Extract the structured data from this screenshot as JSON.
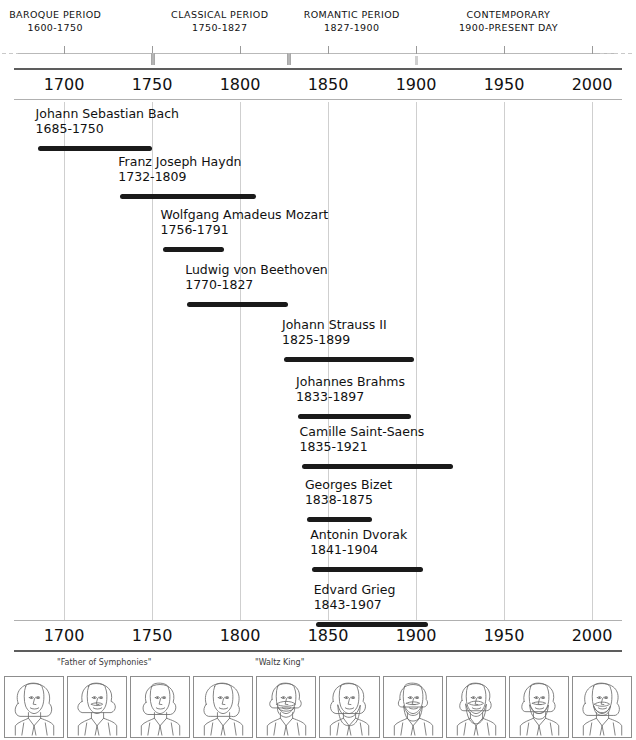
{
  "chart_data": {
    "type": "timeline",
    "axis": {
      "min": 1685,
      "max": 2010,
      "ticks": [
        1700,
        1750,
        1800,
        1850,
        1900,
        1950,
        2000
      ],
      "tick_labels": [
        "1700",
        "1750",
        "1800",
        "1850",
        "1900",
        "1950",
        "2000"
      ],
      "gridlines": [
        1700,
        1750,
        1800,
        1850,
        1900,
        1950,
        2000
      ],
      "axis_repeated_top_and_bottom": true
    },
    "periods": [
      {
        "name": "BAROQUE PERIOD",
        "years": "1600-1750",
        "start": 1600,
        "end": 1750
      },
      {
        "name": "CLASSICAL PERIOD",
        "years": "1750-1827",
        "start": 1750,
        "end": 1827
      },
      {
        "name": "ROMANTIC PERIOD",
        "years": "1827-1900",
        "start": 1827,
        "end": 1900
      },
      {
        "name": "CONTEMPORARY",
        "years": "1900-PRESENT DAY",
        "start": 1900,
        "end": 2010
      }
    ],
    "composers": [
      {
        "name": "Johann Sebastian Bach",
        "dates": "1685-1750",
        "birth": 1685,
        "death": 1750
      },
      {
        "name": "Franz Joseph Haydn",
        "dates": "1732-1809",
        "birth": 1732,
        "death": 1809
      },
      {
        "name": "Wolfgang Amadeus Mozart",
        "dates": "1756-1791",
        "birth": 1756,
        "death": 1791
      },
      {
        "name": "Ludwig von Beethoven",
        "dates": "1770-1827",
        "birth": 1770,
        "death": 1827
      },
      {
        "name": "Johann Strauss II",
        "dates": "1825-1899",
        "birth": 1825,
        "death": 1899
      },
      {
        "name": "Johannes Brahms",
        "dates": "1833-1897",
        "birth": 1833,
        "death": 1897
      },
      {
        "name": "Camille Saint-Saens",
        "dates": "1835-1921",
        "birth": 1835,
        "death": 1921
      },
      {
        "name": "Georges Bizet",
        "dates": "1838-1875",
        "birth": 1838,
        "death": 1875
      },
      {
        "name": "Antonin Dvorak",
        "dates": "1841-1904",
        "birth": 1841,
        "death": 1904
      },
      {
        "name": "Edvard Grieg",
        "dates": "1843-1907",
        "birth": 1843,
        "death": 1907
      }
    ],
    "nicknames": [
      {
        "label": "\"Father of Symphonies\"",
        "refers_to": "Franz Joseph Haydn"
      },
      {
        "label": "\"Waltz King\"",
        "refers_to": "Johann Strauss II"
      }
    ],
    "portraits": [
      {
        "label": "Johann Sebastian Bach"
      },
      {
        "label": "Franz Joseph Haydn"
      },
      {
        "label": "Wolfgang Amadeus Mozart"
      },
      {
        "label": "Ludwig von Beethoven"
      },
      {
        "label": "Johann Strauss II"
      },
      {
        "label": "Johannes Brahms"
      },
      {
        "label": "Camille Saint-Saens"
      },
      {
        "label": "Georges Bizet"
      },
      {
        "label": "Antonin Dvorak"
      },
      {
        "label": "Edvard Grieg"
      }
    ],
    "colors": {
      "bar": "#1a1a1a",
      "grid": "#cfcfcf",
      "axis": "#5d5d5d",
      "text": "#111111",
      "background": "#ffffff"
    }
  }
}
